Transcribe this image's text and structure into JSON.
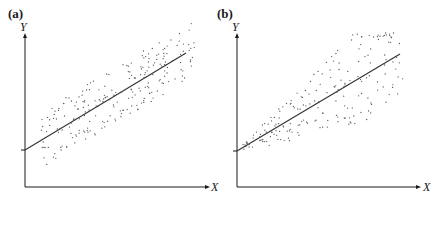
{
  "figure": {
    "panels": [
      {
        "label": "(a)",
        "y_axis_label": "Y",
        "x_axis_label": "X",
        "description": "Homoscedastic scatter around regression line"
      },
      {
        "label": "(b)",
        "y_axis_label": "Y",
        "x_axis_label": "X",
        "description": "Heteroscedastic scatter, spread increasing with X"
      }
    ],
    "colors": {
      "axis": "#1a1a1a",
      "line": "#333333",
      "points": "#555555",
      "background": "#ffffff"
    }
  },
  "chart_data": [
    {
      "type": "scatter",
      "title": "(a)",
      "xlabel": "X",
      "ylabel": "Y",
      "grid": false,
      "legend": null,
      "ticks": "none",
      "regression_line": {
        "x": [
          0,
          1
        ],
        "y": [
          0.24,
          0.88
        ]
      },
      "spread": "constant",
      "annotations": [
        "intercept tick on Y axis"
      ]
    },
    {
      "type": "scatter",
      "title": "(b)",
      "xlabel": "X",
      "ylabel": "Y",
      "grid": false,
      "legend": null,
      "ticks": "none",
      "regression_line": {
        "x": [
          0,
          1
        ],
        "y": [
          0.24,
          0.88
        ]
      },
      "spread": "increasing with X (fan shape)",
      "annotations": [
        "intercept tick on Y axis"
      ]
    }
  ]
}
